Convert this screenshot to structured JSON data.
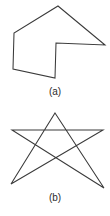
{
  "page": {
    "background_color": "#ffffff",
    "stroke_color": "#3a3a3a",
    "text_color": "#2b2b2b"
  },
  "figures": [
    {
      "id": "figure-a",
      "caption": "(a)",
      "shape_name": "concave-polygon",
      "closed": true,
      "vertex_count": 6,
      "points": "58,6 105,45 56,43 55,78 13,69 14,33",
      "vertices": [
        {
          "label": "apex-top",
          "x": 58,
          "y": 6
        },
        {
          "label": "point-right",
          "x": 105,
          "y": 45
        },
        {
          "label": "notch-inner",
          "x": 56,
          "y": 43
        },
        {
          "label": "bottom-right",
          "x": 55,
          "y": 78
        },
        {
          "label": "bottom-left",
          "x": 13,
          "y": 69
        },
        {
          "label": "left-upper",
          "x": 14,
          "y": 33
        }
      ]
    },
    {
      "id": "figure-b",
      "caption": "(b)",
      "shape_name": "pentagram-star",
      "closed": true,
      "vertex_count": 5,
      "points": "55,8 104,83 12,25 103,25 11,79",
      "vertices": [
        {
          "label": "apex-top",
          "x": 55,
          "y": 8
        },
        {
          "label": "point-bottom-right",
          "x": 104,
          "y": 83
        },
        {
          "label": "point-left",
          "x": 12,
          "y": 25
        },
        {
          "label": "point-right",
          "x": 103,
          "y": 25
        },
        {
          "label": "point-bottom-left",
          "x": 11,
          "y": 79
        }
      ]
    }
  ]
}
